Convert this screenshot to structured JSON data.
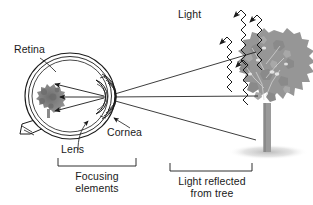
{
  "figure": {
    "title_text": "",
    "background_color": "#ffffff",
    "line_color": "#1a1a1a",
    "tree_color": "#8c8c8c",
    "trunk_color": "#909090",
    "retina_image_color": "#808080",
    "shadow_color": "#bdbdbd"
  },
  "labels": {
    "retina": "Retina",
    "lens": "Lens",
    "cornea": "Cornea",
    "light": "Light",
    "focusing_line1": "Focusing",
    "focusing_line2": "elements",
    "reflected_line1": "Light reflected",
    "reflected_line2": "from tree"
  },
  "diagram": {
    "type": "optics-eye-vision",
    "parts": [
      {
        "name": "eyeball",
        "label": "Retina"
      },
      {
        "name": "lens",
        "label": "Lens"
      },
      {
        "name": "cornea",
        "label": "Cornea"
      },
      {
        "name": "optic-nerve",
        "label": ""
      },
      {
        "name": "retinal-image",
        "label": ""
      },
      {
        "name": "tree",
        "label": ""
      },
      {
        "name": "incoming-light-waves",
        "label": "Light"
      },
      {
        "name": "reflected-rays",
        "label": ""
      }
    ],
    "brackets": [
      {
        "name": "focusing-elements-bracket",
        "caption": "Focusing elements"
      },
      {
        "name": "light-reflected-bracket",
        "caption": "Light reflected from tree"
      }
    ],
    "ray_count_incoming": 3,
    "ray_count_reflected": 3,
    "arrow_count_retina": 3
  }
}
